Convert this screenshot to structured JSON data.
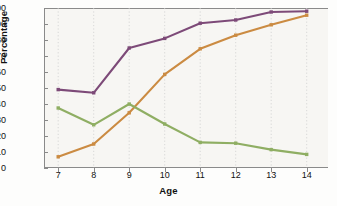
{
  "chart_data": {
    "type": "line",
    "title": "",
    "xlabel": "Age",
    "ylabel": "Percentage",
    "x": [
      7,
      8,
      9,
      10,
      11,
      12,
      13,
      14
    ],
    "categories": [
      "7",
      "8",
      "9",
      "10",
      "11",
      "12",
      "13",
      "14"
    ],
    "xlim": [
      6.6,
      14.6
    ],
    "ylim": [
      0,
      100
    ],
    "ytick_labels": [
      "0",
      "10",
      "20",
      "30",
      "40",
      "50",
      "60",
      "70",
      "80",
      "90",
      "100"
    ],
    "yticks": [
      0,
      10,
      20,
      30,
      40,
      50,
      60,
      70,
      80,
      90,
      100
    ],
    "grid": "vertical-dotted",
    "legend": "none",
    "series": [
      {
        "name": "purple-series",
        "color": "#7d4a78",
        "marker": "square",
        "values": [
          49,
          47,
          75,
          81,
          90.5,
          92.5,
          97.5,
          98
        ]
      },
      {
        "name": "orange-series",
        "color": "#cb8b42",
        "marker": "square",
        "values": [
          7,
          15,
          34.5,
          58.5,
          74.5,
          83,
          89.5,
          95.5
        ]
      },
      {
        "name": "green-series",
        "color": "#8fae63",
        "marker": "square",
        "values": [
          37.5,
          27,
          40,
          27.5,
          16,
          15.5,
          11.5,
          8.5
        ]
      }
    ]
  },
  "colors": {
    "background": "#fdfdfc",
    "plot_background": "#f7f6f3",
    "axis": "#8a8a8a",
    "gridline": "#cfcfcf",
    "text": "#111111"
  }
}
